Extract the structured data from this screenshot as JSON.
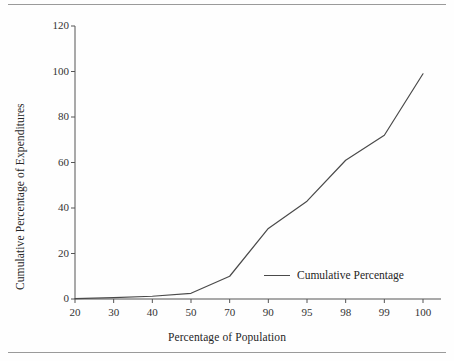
{
  "chart_data": {
    "type": "line",
    "title": "",
    "subtitle": "",
    "xlabel": "Percentage of Population",
    "ylabel": "Cumulative Percentage of Expenditures",
    "categories": [
      "20",
      "30",
      "40",
      "50",
      "70",
      "90",
      "95",
      "98",
      "99",
      "100"
    ],
    "series": [
      {
        "name": "Cumulative Percentage",
        "values": [
          0.2,
          0.6,
          1.2,
          2.5,
          10,
          31,
          43,
          61,
          72,
          99
        ],
        "color": "#4a4a4a"
      }
    ],
    "y_ticks": [
      0,
      20,
      40,
      60,
      80,
      100,
      120
    ],
    "ylim": [
      0,
      120
    ],
    "x_axis_type": "category",
    "grid": false,
    "legend_position": "inside-lower-right",
    "legend_entries": [
      "Cumulative Percentage"
    ]
  },
  "figure": {
    "top_rule": "horizontal-rule",
    "bottom_rule": "horizontal-rule"
  },
  "legend": {
    "label": "Cumulative Percentage"
  }
}
